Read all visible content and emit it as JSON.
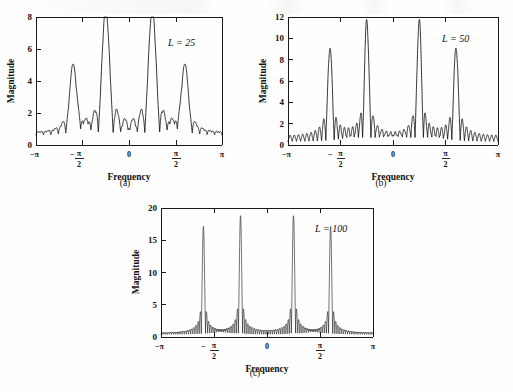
{
  "figure": {
    "panels": [
      {
        "id": "a",
        "caption": "(a)",
        "annotation_var": "L",
        "annotation_eq": "=",
        "annotation_val": "25",
        "xlabel": "Frequency",
        "ylabel": "Magnitude"
      },
      {
        "id": "b",
        "caption": "(b)",
        "annotation_var": "L",
        "annotation_eq": "=",
        "annotation_val": "50",
        "xlabel": "Frequency",
        "ylabel": "Magnitude"
      },
      {
        "id": "c",
        "caption": "(c)",
        "annotation_var": "L",
        "annotation_eq": "=",
        "annotation_val": "100",
        "xlabel": "Frequency",
        "ylabel": "Magnitude"
      }
    ]
  },
  "chart_data": [
    {
      "type": "line",
      "panel": "a",
      "title": "",
      "subtitle": "L = 25",
      "xlabel": "Frequency",
      "ylabel": "Magnitude",
      "xlim": [
        -3.14159,
        3.14159
      ],
      "ylim": [
        0,
        8
      ],
      "xticks": [
        -3.14159,
        -1.5708,
        0,
        1.5708,
        3.14159
      ],
      "xticklabels": [
        "-π",
        "-π/2",
        "0",
        "π/2",
        "π"
      ],
      "yticks": [
        0,
        2,
        4,
        6,
        8
      ],
      "yticklabels": [
        "0",
        "2",
        "4",
        "6",
        "8"
      ],
      "grid": false,
      "legend": false,
      "window_length_L": 25,
      "peaks": [
        {
          "frequency": -1.885,
          "frequency_label": "-0.6π",
          "magnitude": 4.2
        },
        {
          "frequency": -0.785,
          "frequency_label": "-0.25π",
          "magnitude": 7.8
        },
        {
          "frequency": 0.785,
          "frequency_label": "0.25π",
          "magnitude": 7.8
        },
        {
          "frequency": 1.885,
          "frequency_label": "0.6π",
          "magnitude": 4.2
        }
      ],
      "sidelobe_typical_magnitude": 0.9,
      "description": "Magnitude spectrum of two sinusoids windowed by a rectangular window of length 25; four mainlobes with broad sidelobe ripple"
    },
    {
      "type": "line",
      "panel": "b",
      "title": "",
      "subtitle": "L = 50",
      "xlabel": "Frequency",
      "ylabel": "Magnitude",
      "xlim": [
        -3.14159,
        3.14159
      ],
      "ylim": [
        0,
        12
      ],
      "xticks": [
        -3.14159,
        -1.5708,
        0,
        1.5708,
        3.14159
      ],
      "xticklabels": [
        "-π",
        "-π/2",
        "0",
        "π/2",
        "π"
      ],
      "yticks": [
        0,
        2,
        4,
        6,
        8,
        10,
        12
      ],
      "yticklabels": [
        "0",
        "2",
        "4",
        "6",
        "8",
        "10",
        "12"
      ],
      "grid": false,
      "legend": false,
      "window_length_L": 50,
      "peaks": [
        {
          "frequency": -1.885,
          "frequency_label": "-0.6π",
          "magnitude": 8.6
        },
        {
          "frequency": -0.785,
          "frequency_label": "-0.25π",
          "magnitude": 11.1
        },
        {
          "frequency": 0.785,
          "frequency_label": "0.25π",
          "magnitude": 11.1
        },
        {
          "frequency": 1.885,
          "frequency_label": "0.6π",
          "magnitude": 8.6
        }
      ],
      "sidelobe_typical_magnitude": 0.7,
      "description": "Magnitude spectrum with rectangular window of length 50; narrower mainlobes and denser sidelobe ripple"
    },
    {
      "type": "line",
      "panel": "c",
      "title": "",
      "subtitle": "L = 100",
      "xlabel": "Frequency",
      "ylabel": "Magnitude",
      "xlim": [
        -3.14159,
        3.14159
      ],
      "ylim": [
        0,
        20
      ],
      "xticks": [
        -3.14159,
        -1.5708,
        0,
        1.5708,
        3.14159
      ],
      "xticklabels": [
        "-π",
        "-π/2",
        "0",
        "π/2",
        "π"
      ],
      "yticks": [
        0,
        5,
        10,
        15,
        20
      ],
      "yticklabels": [
        "0",
        "5",
        "10",
        "15",
        "20"
      ],
      "grid": false,
      "legend": false,
      "window_length_L": 100,
      "peaks": [
        {
          "frequency": -1.885,
          "frequency_label": "-0.6π",
          "magnitude": 16.6
        },
        {
          "frequency": -0.785,
          "frequency_label": "-0.25π",
          "magnitude": 18.3
        },
        {
          "frequency": 0.785,
          "frequency_label": "0.25π",
          "magnitude": 18.3
        },
        {
          "frequency": 1.885,
          "frequency_label": "0.6π",
          "magnitude": 16.6
        }
      ],
      "sidelobe_typical_magnitude": 0.8,
      "description": "Magnitude spectrum with rectangular window of length 100; very narrow spikes with dense solid-looking sidelobe band"
    }
  ],
  "colors": {
    "ink": "#111111",
    "paper": "#fefefe"
  }
}
